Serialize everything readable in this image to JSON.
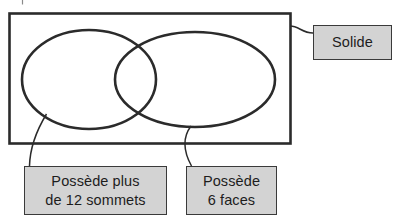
{
  "diagram": {
    "type": "venn-diagram",
    "language": "fr",
    "universe": {
      "name": "solide-set-rectangle",
      "label": "Solide"
    },
    "sets": [
      {
        "name": "left-ellipse",
        "label_lines": [
          "Possède plus",
          "de 12 sommets"
        ],
        "label_text": "Possède plus de 12 sommets"
      },
      {
        "name": "right-ellipse",
        "label_lines": [
          "Possède",
          "6 faces"
        ],
        "label_text": "Possède 6 faces"
      }
    ],
    "colors": {
      "stroke": "#2b2b2b",
      "label_fill": "#d3d3d3",
      "label_border": "#3a3a3a",
      "background": "#ffffff",
      "text": "#1d1d1d"
    }
  },
  "labels": {
    "solide": "Solide",
    "vertices_line1": "Possède plus",
    "vertices_line2": "de 12 sommets",
    "faces_line1": "Possède",
    "faces_line2": "6 faces"
  }
}
